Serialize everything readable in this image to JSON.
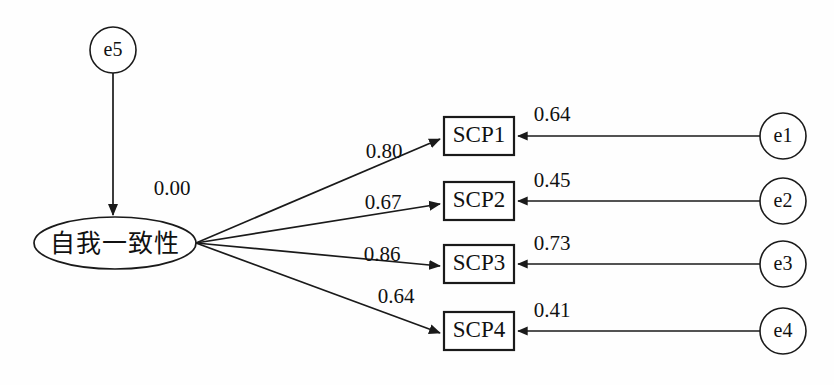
{
  "diagram": {
    "type": "sem-path-diagram",
    "title": "",
    "background_color": "#fefefe",
    "stroke_color": "#1a1a1a",
    "latent": {
      "id": "self-consistency",
      "label": "自我一致性",
      "shape": "ellipse",
      "disturbance_value": "0.00"
    },
    "disturbance": {
      "id": "e5",
      "label": "e5",
      "shape": "circle",
      "target": "self-consistency",
      "value": "0.00"
    },
    "indicators": [
      {
        "id": "SCP1",
        "label": "SCP1",
        "shape": "rect",
        "loading": "0.80",
        "error_id": "e1",
        "error_label": "e1",
        "error_value": "0.64"
      },
      {
        "id": "SCP2",
        "label": "SCP2",
        "shape": "rect",
        "loading": "0.67",
        "error_id": "e2",
        "error_label": "e2",
        "error_value": "0.45"
      },
      {
        "id": "SCP3",
        "label": "SCP3",
        "shape": "rect",
        "loading": "0.86",
        "error_id": "e3",
        "error_label": "e3",
        "error_value": "0.73"
      },
      {
        "id": "SCP4",
        "label": "SCP4",
        "shape": "rect",
        "loading": "0.64",
        "error_id": "e4",
        "error_label": "e4",
        "error_value": "0.41"
      }
    ]
  }
}
